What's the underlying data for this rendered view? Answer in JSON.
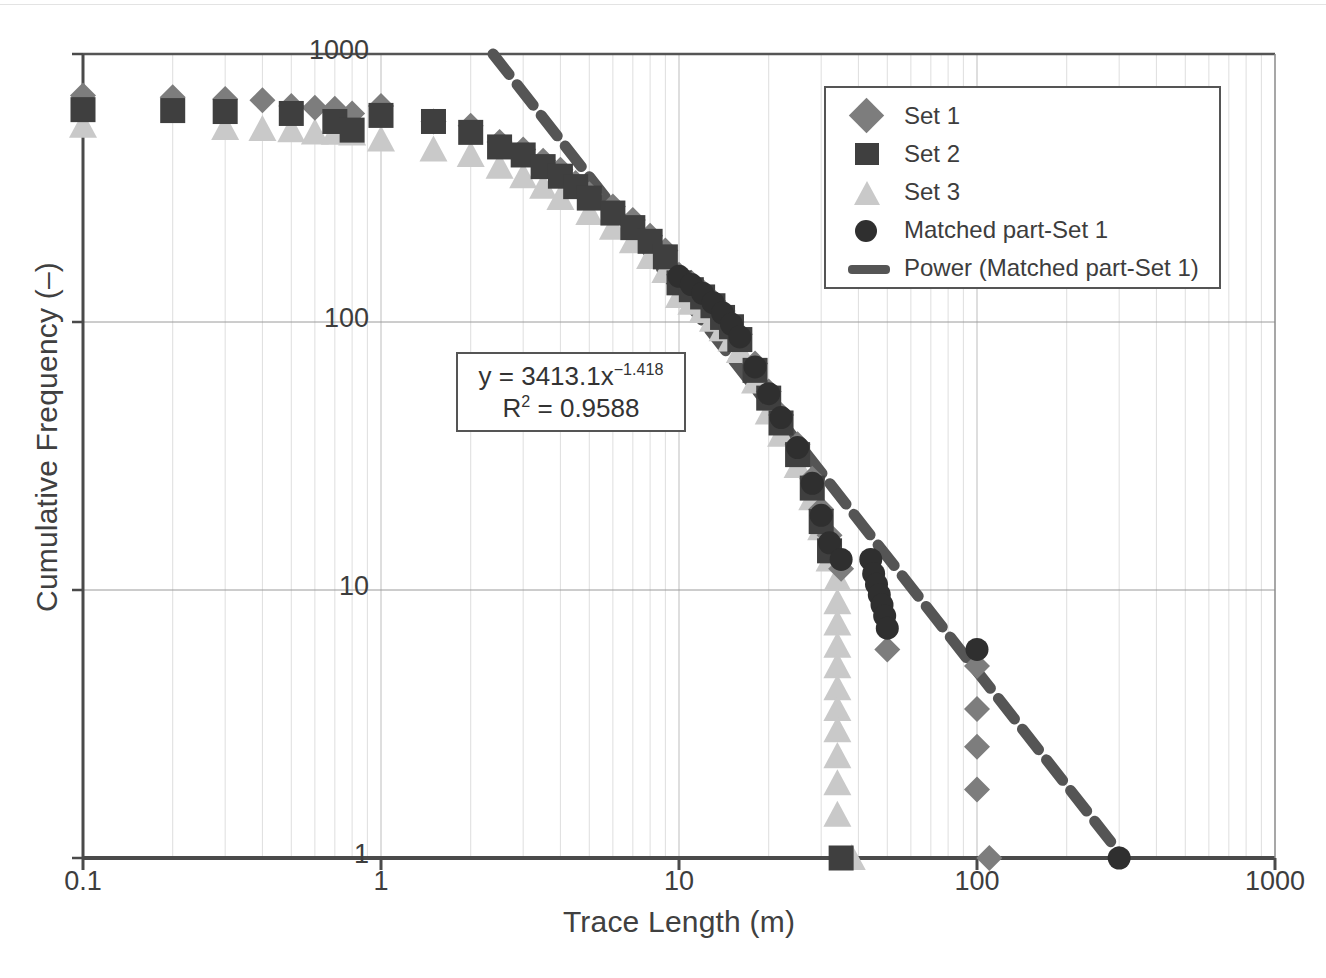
{
  "figure": {
    "axes": {
      "xlabel": "Trace Length (m)",
      "ylabel": "Cumulative Frequency (–)",
      "xticks": [
        "0.1",
        "1",
        "10",
        "100",
        "1000"
      ],
      "yticks": [
        "1",
        "10",
        "100",
        "1000"
      ]
    },
    "legend": {
      "items": [
        {
          "label": "Set 1",
          "marker": "diamond",
          "color": "#7d7d7d"
        },
        {
          "label": "Set 2",
          "marker": "square",
          "color": "#3f3f3f"
        },
        {
          "label": "Set 3",
          "marker": "triangle",
          "color": "#c9c9c9"
        },
        {
          "label": "Matched part-Set 1",
          "marker": "circle",
          "color": "#2f2f2f"
        },
        {
          "label": "Power (Matched part-Set 1)",
          "marker": "dashed-line",
          "color": "#555555"
        }
      ]
    },
    "annotation": {
      "equation_prefix": "y = 3413.1x",
      "equation_exponent": "−1.418",
      "r2_prefix": "R",
      "r2_sup": "2",
      "r2_value": " = 0.9588",
      "coefficient": 3413.1,
      "exponent": -1.418,
      "r_squared": 0.9588
    },
    "caption": " "
  },
  "chart_data": {
    "type": "scatter",
    "title": "",
    "xlabel": "Trace Length (m)",
    "ylabel": "Cumulative Frequency (–)",
    "xscale": "log",
    "yscale": "log",
    "xlim": [
      0.1,
      1000
    ],
    "ylim": [
      1,
      1000
    ],
    "xticks": [
      0.1,
      1,
      10,
      100,
      1000
    ],
    "yticks": [
      1,
      10,
      100,
      1000
    ],
    "grid": "minor-vertical-and-major-horizontal",
    "legend_position": "upper-right-inside",
    "fit": {
      "name": "Power (Matched part-Set 1)",
      "form": "y = 3413.1 * x^-1.418",
      "coefficient": 3413.1,
      "exponent": -1.418,
      "r_squared": 0.9588,
      "x_range": [
        1.9,
        300
      ]
    },
    "series": [
      {
        "name": "Set 1",
        "marker": "diamond",
        "color": "#7d7d7d",
        "points": [
          [
            0.1,
            700
          ],
          [
            0.2,
            690
          ],
          [
            0.3,
            680
          ],
          [
            0.4,
            672
          ],
          [
            0.5,
            640
          ],
          [
            0.6,
            630
          ],
          [
            0.7,
            625
          ],
          [
            0.8,
            600
          ],
          [
            1.0,
            640
          ],
          [
            1.5,
            560
          ],
          [
            2.0,
            540
          ],
          [
            2.5,
            470
          ],
          [
            3.0,
            440
          ],
          [
            3.5,
            400
          ],
          [
            4.0,
            370
          ],
          [
            4.5,
            330
          ],
          [
            5.0,
            300
          ],
          [
            6.0,
            270
          ],
          [
            7.0,
            240
          ],
          [
            8.0,
            210
          ],
          [
            9.0,
            185
          ],
          [
            10.0,
            150
          ],
          [
            11.0,
            140
          ],
          [
            12.0,
            130
          ],
          [
            13.0,
            120
          ],
          [
            14.0,
            110
          ],
          [
            15.0,
            100
          ],
          [
            16.0,
            90
          ],
          [
            18.0,
            70
          ],
          [
            20.0,
            55
          ],
          [
            22.0,
            45
          ],
          [
            25.0,
            35
          ],
          [
            28.0,
            26
          ],
          [
            30.0,
            20
          ],
          [
            32.0,
            16
          ],
          [
            35.0,
            12
          ],
          [
            50.0,
            6.0
          ],
          [
            100.0,
            5.2
          ],
          [
            100.0,
            3.6
          ],
          [
            100.0,
            2.6
          ],
          [
            100.0,
            1.8
          ],
          [
            110.0,
            1.0
          ]
        ]
      },
      {
        "name": "Set 2",
        "marker": "square",
        "color": "#3f3f3f",
        "points": [
          [
            0.1,
            620
          ],
          [
            0.2,
            615
          ],
          [
            0.3,
            610
          ],
          [
            0.5,
            600
          ],
          [
            0.7,
            560
          ],
          [
            0.8,
            520
          ],
          [
            1.0,
            590
          ],
          [
            1.5,
            560
          ],
          [
            2.0,
            510
          ],
          [
            2.5,
            450
          ],
          [
            3.0,
            420
          ],
          [
            3.5,
            380
          ],
          [
            4.0,
            350
          ],
          [
            4.5,
            320
          ],
          [
            5.0,
            290
          ],
          [
            6.0,
            255
          ],
          [
            7.0,
            225
          ],
          [
            8.0,
            200
          ],
          [
            9.0,
            175
          ],
          [
            10.0,
            140
          ],
          [
            11.0,
            132
          ],
          [
            12.0,
            124
          ],
          [
            13.0,
            115
          ],
          [
            14.0,
            104
          ],
          [
            15.0,
            96
          ],
          [
            16.0,
            86
          ],
          [
            18.0,
            66
          ],
          [
            20.0,
            52
          ],
          [
            22.0,
            42
          ],
          [
            25.0,
            32
          ],
          [
            28.0,
            24
          ],
          [
            30.0,
            18
          ],
          [
            32.0,
            14
          ],
          [
            35.0,
            1.0
          ]
        ]
      },
      {
        "name": "Set 3",
        "marker": "triangle",
        "color": "#c9c9c9",
        "points": [
          [
            0.1,
            540
          ],
          [
            0.3,
            530
          ],
          [
            0.4,
            525
          ],
          [
            0.5,
            520
          ],
          [
            0.6,
            510
          ],
          [
            0.7,
            508
          ],
          [
            0.8,
            505
          ],
          [
            1.0,
            480
          ],
          [
            1.5,
            440
          ],
          [
            2.0,
            420
          ],
          [
            2.5,
            380
          ],
          [
            3.0,
            350
          ],
          [
            3.5,
            320
          ],
          [
            4.0,
            290
          ],
          [
            5.0,
            255
          ],
          [
            6.0,
            225
          ],
          [
            7.0,
            200
          ],
          [
            8.0,
            175
          ],
          [
            9.0,
            155
          ],
          [
            10.0,
            125
          ],
          [
            11.0,
            118
          ],
          [
            12.0,
            110
          ],
          [
            13.0,
            102
          ],
          [
            14.0,
            94
          ],
          [
            15.0,
            86
          ],
          [
            16.0,
            78
          ],
          [
            18.0,
            60
          ],
          [
            20.0,
            46
          ],
          [
            22.0,
            38
          ],
          [
            25.0,
            29
          ],
          [
            28.0,
            22
          ],
          [
            30.0,
            17
          ],
          [
            32.0,
            13
          ],
          [
            34.0,
            11
          ],
          [
            34.0,
            9.0
          ],
          [
            34.0,
            7.5
          ],
          [
            34.0,
            6.2
          ],
          [
            34.0,
            5.2
          ],
          [
            34.0,
            4.3
          ],
          [
            34.0,
            3.6
          ],
          [
            34.0,
            3.0
          ],
          [
            34.0,
            2.4
          ],
          [
            34.0,
            1.9
          ],
          [
            34.0,
            1.45
          ],
          [
            38.0,
            1.0
          ]
        ]
      },
      {
        "name": "Matched part-Set 1",
        "marker": "circle",
        "color": "#2f2f2f",
        "points": [
          [
            10.0,
            148
          ],
          [
            11.0,
            138
          ],
          [
            12.0,
            128
          ],
          [
            13.0,
            118
          ],
          [
            14.0,
            108
          ],
          [
            15.0,
            98
          ],
          [
            16.0,
            88
          ],
          [
            18.0,
            68
          ],
          [
            20.0,
            54
          ],
          [
            22.0,
            44
          ],
          [
            25.0,
            34
          ],
          [
            28.0,
            25
          ],
          [
            30.0,
            19
          ],
          [
            32.0,
            15
          ],
          [
            35.0,
            13
          ],
          [
            44.0,
            13
          ],
          [
            45.0,
            11.5
          ],
          [
            46.0,
            10.5
          ],
          [
            47.0,
            9.6
          ],
          [
            48.0,
            8.8
          ],
          [
            49.0,
            8.0
          ],
          [
            50.0,
            7.2
          ],
          [
            100.0,
            6.0
          ],
          [
            300.0,
            1.0
          ]
        ]
      }
    ]
  }
}
